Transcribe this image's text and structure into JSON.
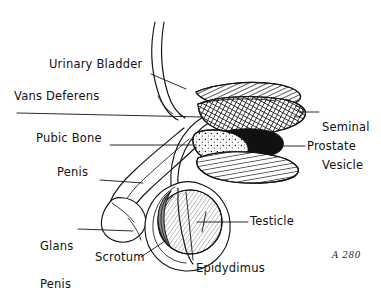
{
  "figure": {
    "style": "hand-drawn pen and ink line drawing",
    "background_color": "#ffffff",
    "ink_color": "#141414"
  },
  "labels": [
    {
      "id": "urinary-bladder",
      "text": "Urinary Bladder",
      "lines": [
        "Urinary Bladder"
      ],
      "x": 49,
      "y": 58,
      "align": "left",
      "leader": {
        "x1": 151,
        "y1": 74,
        "x2": 186,
        "y2": 89
      }
    },
    {
      "id": "vans-deferens",
      "text": "Vans Deferens",
      "lines": [
        "Vans Deferens"
      ],
      "x": 14,
      "y": 90,
      "align": "left",
      "leader": {
        "x1": 17,
        "y1": 113,
        "x2": 203,
        "y2": 117
      }
    },
    {
      "id": "pubic-bone",
      "text": "Pubic Bone",
      "lines": [
        "Pubic Bone"
      ],
      "x": 36,
      "y": 132,
      "align": "left",
      "leader": {
        "x1": 110,
        "y1": 145,
        "x2": 196,
        "y2": 145
      }
    },
    {
      "id": "penis",
      "text": "Penis",
      "lines": [
        "Penis"
      ],
      "x": 57,
      "y": 166,
      "align": "left",
      "leader": {
        "x1": 100,
        "y1": 180,
        "x2": 143,
        "y2": 183
      }
    },
    {
      "id": "glans-penis",
      "text": "Glans Penis",
      "lines": [
        "Glans",
        "Penis"
      ],
      "x": 40,
      "y": 215,
      "align": "left",
      "leader": {
        "x1": 78,
        "y1": 229,
        "x2": 133,
        "y2": 231
      }
    },
    {
      "id": "scrotum",
      "text": "Scrotum",
      "lines": [
        "Scrotum"
      ],
      "x": 95,
      "y": 251,
      "align": "left",
      "leader": {
        "x1": 141,
        "y1": 257,
        "x2": 165,
        "y2": 241
      }
    },
    {
      "id": "seminal-vesicle",
      "text": "Seminal Vesicle",
      "lines": [
        "Seminal",
        "Vesicle"
      ],
      "x": 322,
      "y": 96,
      "align": "left",
      "leader": {
        "x1": 300,
        "y1": 112,
        "x2": 319,
        "y2": 112
      }
    },
    {
      "id": "prostate",
      "text": "Prostate",
      "lines": [
        "Prostate"
      ],
      "x": 307,
      "y": 140,
      "align": "left",
      "leader": {
        "x1": 272,
        "y1": 146,
        "x2": 305,
        "y2": 146
      }
    },
    {
      "id": "testicle",
      "text": "Testicle",
      "lines": [
        "Testicle"
      ],
      "x": 250,
      "y": 215,
      "align": "left",
      "leader": {
        "x1": 197,
        "y1": 222,
        "x2": 248,
        "y2": 222
      }
    },
    {
      "id": "epidydimus",
      "text": "Epidydimus",
      "lines": [
        "Epidydimus"
      ],
      "x": 196,
      "y": 262,
      "align": "left",
      "leader": {
        "x1": 193,
        "y1": 262,
        "x2": 186,
        "y2": 190
      }
    }
  ],
  "signature": {
    "text": "A 280",
    "x": 332,
    "y": 250
  },
  "structures": [
    {
      "id": "urethra-tube",
      "name": "urinary bladder neck / urethra tube",
      "fill": "white"
    },
    {
      "id": "vas-deferens-duct",
      "name": "vas deferens duct",
      "fill": "white"
    },
    {
      "id": "seminal-vesicle-upper",
      "name": "seminal vesicle (diagonal hatch)",
      "fill": "diagonal-hatch"
    },
    {
      "id": "seminal-vesicle-lower",
      "name": "seminal vesicle body (cross hatch)",
      "fill": "cross-hatch"
    },
    {
      "id": "prostate-mass",
      "name": "prostate",
      "fill": "solid-black"
    },
    {
      "id": "pubic-bone-oval",
      "name": "pubic bone",
      "fill": "stipple"
    },
    {
      "id": "rectum-stripe",
      "name": "striped lower structure",
      "fill": "vertical-hatch"
    },
    {
      "id": "penis-shaft",
      "name": "penis shaft",
      "fill": "white"
    },
    {
      "id": "glans",
      "name": "glans penis",
      "fill": "white"
    },
    {
      "id": "scrotum-sac",
      "name": "scrotum",
      "fill": "white"
    },
    {
      "id": "testicle-ball",
      "name": "testicle",
      "fill": "light-hatch"
    },
    {
      "id": "epididymis-crescent",
      "name": "epididymis",
      "fill": "grey"
    }
  ]
}
